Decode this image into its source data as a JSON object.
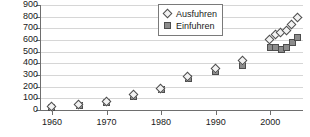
{
  "chart_data": {
    "type": "scatter",
    "title": "",
    "xlabel": "",
    "ylabel": "",
    "xlim": [
      1958,
      2006
    ],
    "ylim": [
      0,
      900
    ],
    "ytick_values": [
      0,
      100,
      200,
      300,
      400,
      500,
      600,
      700,
      800,
      900
    ],
    "ytick_labels": [
      "0",
      "100",
      "200",
      "300",
      "400",
      "500",
      "600",
      "700",
      "800",
      "900"
    ],
    "xtick_values": [
      1960,
      1970,
      1980,
      1990,
      2000
    ],
    "xtick_labels": [
      "1960",
      "1970",
      "1980",
      "1990",
      "2000"
    ],
    "grid": true,
    "legend_position": "top-center",
    "series": [
      {
        "name": "Ausfuhren",
        "marker": "diamond",
        "color": "#f2f2f2",
        "edge_color": "#4d4d4d",
        "points": [
          {
            "x": 1960,
            "y": 25
          },
          {
            "x": 1965,
            "y": 45
          },
          {
            "x": 1970,
            "y": 70
          },
          {
            "x": 1975,
            "y": 125
          },
          {
            "x": 1980,
            "y": 180
          },
          {
            "x": 1985,
            "y": 285
          },
          {
            "x": 1990,
            "y": 350
          },
          {
            "x": 1995,
            "y": 420
          },
          {
            "x": 2000,
            "y": 600
          },
          {
            "x": 2001,
            "y": 640
          },
          {
            "x": 2002,
            "y": 660
          },
          {
            "x": 2003,
            "y": 680
          },
          {
            "x": 2004,
            "y": 730
          },
          {
            "x": 2005,
            "y": 790
          }
        ]
      },
      {
        "name": "Einfuhren",
        "marker": "square",
        "color": "#8c8c8c",
        "edge_color": "#4d4d4d",
        "points": [
          {
            "x": 1960,
            "y": 22
          },
          {
            "x": 1965,
            "y": 42
          },
          {
            "x": 1970,
            "y": 68
          },
          {
            "x": 1975,
            "y": 120
          },
          {
            "x": 1980,
            "y": 175
          },
          {
            "x": 1985,
            "y": 270
          },
          {
            "x": 1990,
            "y": 330
          },
          {
            "x": 1995,
            "y": 380
          },
          {
            "x": 2000,
            "y": 540
          },
          {
            "x": 2001,
            "y": 540
          },
          {
            "x": 2002,
            "y": 520
          },
          {
            "x": 2003,
            "y": 535
          },
          {
            "x": 2004,
            "y": 575
          },
          {
            "x": 2005,
            "y": 625
          }
        ]
      }
    ]
  },
  "legend": {
    "entries": [
      {
        "label": "Ausfuhren",
        "marker": "diamond-icon"
      },
      {
        "label": "Einfuhren",
        "marker": "square-icon"
      }
    ]
  }
}
